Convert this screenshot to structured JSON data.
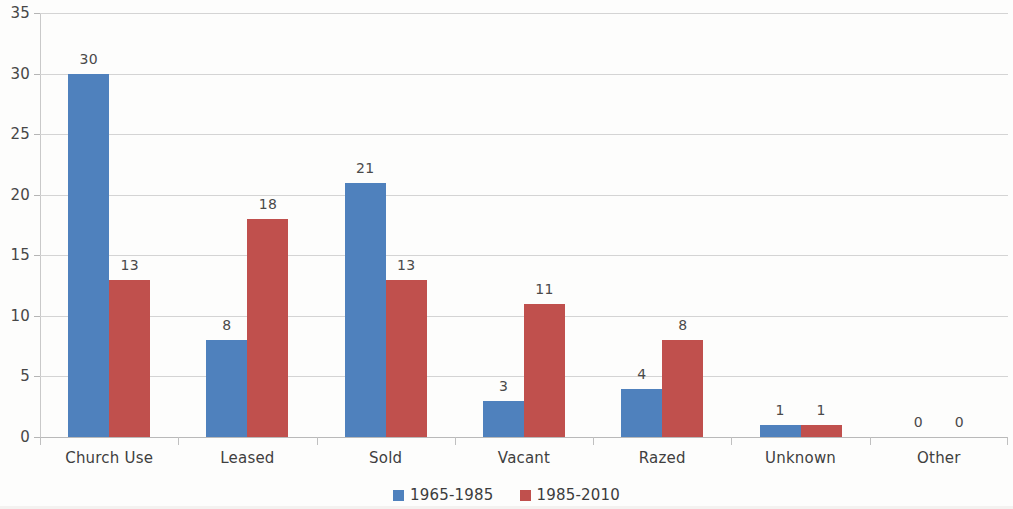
{
  "chart_data": {
    "type": "bar",
    "title": "",
    "subtitle": "",
    "xlabel": "",
    "ylabel": "",
    "categories": [
      "Church Use",
      "Leased",
      "Sold",
      "Vacant",
      "Razed",
      "Unknown",
      "Other"
    ],
    "series": [
      {
        "name": "1965-1985",
        "color": "#4f81bd",
        "values": [
          30,
          8,
          21,
          3,
          4,
          1,
          0
        ]
      },
      {
        "name": "1985-2010",
        "color": "#c0504d",
        "values": [
          13,
          18,
          13,
          11,
          8,
          1,
          0
        ]
      }
    ],
    "ylim": [
      0,
      35
    ],
    "ytick_step": 5,
    "yticks": [
      0,
      5,
      10,
      15,
      20,
      25,
      30,
      35
    ],
    "ytick_labels": [
      "0",
      "5",
      "10",
      "15",
      "20",
      "25",
      "30",
      "35"
    ],
    "grid": true,
    "grid_axis": "y",
    "legend_position": "bottom",
    "data_labels": true,
    "data_label_values": [
      [
        "30",
        "13"
      ],
      [
        "8",
        "18"
      ],
      [
        "21",
        "13"
      ],
      [
        "3",
        "11"
      ],
      [
        "4",
        "8"
      ],
      [
        "1",
        "1"
      ],
      [
        "0",
        "0"
      ]
    ]
  },
  "legend": {
    "items": [
      {
        "label": "1965-1985",
        "color": "#4f81bd"
      },
      {
        "label": "1985-2010",
        "color": "#c0504d"
      }
    ]
  },
  "axes": {
    "y": {
      "labels": [
        "35",
        "30",
        "25",
        "20",
        "15",
        "10",
        "5",
        "0"
      ]
    },
    "x": {
      "labels": [
        "Church Use",
        "Leased",
        "Sold",
        "Vacant",
        "Razed",
        "Unknown",
        "Other"
      ]
    }
  },
  "colors": {
    "series_1": "#4f81bd",
    "series_2": "#c0504d",
    "gridline": "#d4d4d4",
    "axis_text": "#474747",
    "background": "#fdfdfc"
  }
}
